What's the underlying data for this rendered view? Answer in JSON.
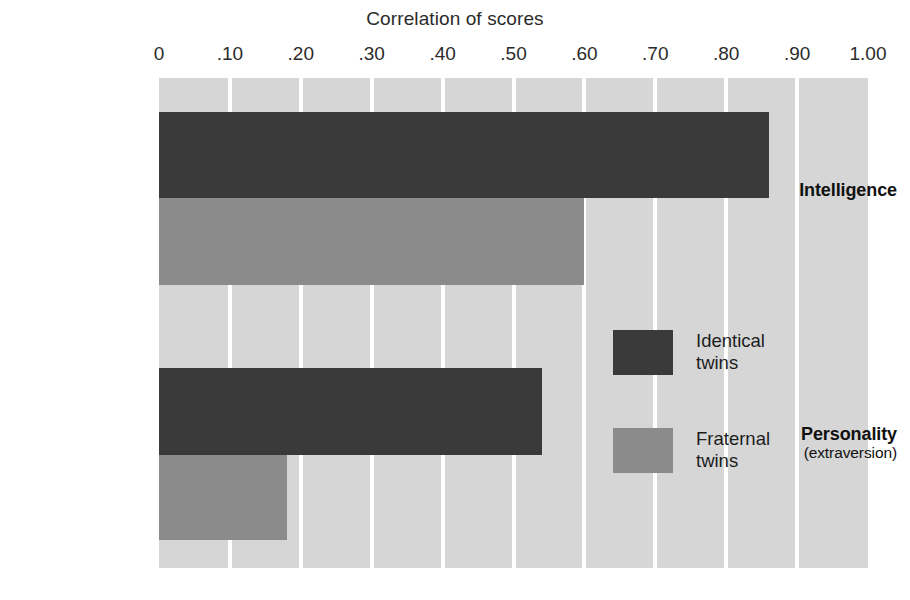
{
  "chart_data": {
    "type": "bar",
    "orientation": "horizontal",
    "title": "Correlation of scores",
    "xlabel": "",
    "ylabel": "",
    "xlim": [
      0,
      1.0
    ],
    "grid": true,
    "grid_axis": "x",
    "legend_position": "center-right-inside",
    "categories": [
      "Intelligence",
      "Personality"
    ],
    "category_sublabels": [
      "",
      "(extraversion)"
    ],
    "tick_values": [
      0,
      0.1,
      0.2,
      0.3,
      0.4,
      0.5,
      0.6,
      0.7,
      0.8,
      0.9,
      1.0
    ],
    "tick_labels": [
      "0",
      ".10",
      ".20",
      ".30",
      ".40",
      ".50",
      ".60",
      ".70",
      ".80",
      ".90",
      "1.00"
    ],
    "series": [
      {
        "name": "Identical twins",
        "legend_label": "Identical\ntwins",
        "color": "#3a3a3a",
        "values": [
          0.86,
          0.54
        ]
      },
      {
        "name": "Fraternal twins",
        "legend_label": "Fraternal\ntwins",
        "color": "#8b8b8b",
        "values": [
          0.6,
          0.18
        ]
      }
    ],
    "plot_background": "#d6d6d6",
    "gridline_color": "#ffffff"
  },
  "axis": {
    "tick_0": "0",
    "tick_1": ".10",
    "tick_2": ".20",
    "tick_3": ".30",
    "tick_4": ".40",
    "tick_5": ".50",
    "tick_6": ".60",
    "tick_7": ".70",
    "tick_8": ".80",
    "tick_9": ".90",
    "tick_10": "1.00"
  },
  "categories": {
    "intelligence": {
      "main": "Intelligence",
      "sub": ""
    },
    "personality": {
      "main": "Personality",
      "sub": "(extraversion)"
    }
  },
  "legend": {
    "identical": "Identical\ntwins",
    "fraternal": "Fraternal\ntwins"
  }
}
